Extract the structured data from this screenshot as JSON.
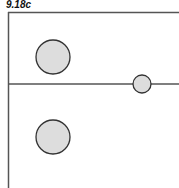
{
  "figure": {
    "label": "9.18c"
  },
  "diagram": {
    "stroke_color": "#555555",
    "circle_fill": "#dddddd",
    "circle_stroke": "#333333",
    "lines": [
      {
        "name": "top-boundary-line",
        "x1": 8,
        "y1": 12.5,
        "x2": 179,
        "y2": 12.5
      },
      {
        "name": "left-boundary-line",
        "x1": 8.5,
        "y1": 12,
        "x2": 8.5,
        "y2": 188
      },
      {
        "name": "middle-horizontal-line",
        "x1": 8,
        "y1": 84,
        "x2": 179,
        "y2": 84
      }
    ],
    "circles": [
      {
        "name": "upper-large-circle",
        "cx": 53,
        "cy": 57,
        "r": 17
      },
      {
        "name": "small-circle-on-line",
        "cx": 142,
        "cy": 84,
        "r": 9
      },
      {
        "name": "lower-large-circle",
        "cx": 53,
        "cy": 137,
        "r": 17
      }
    ]
  }
}
